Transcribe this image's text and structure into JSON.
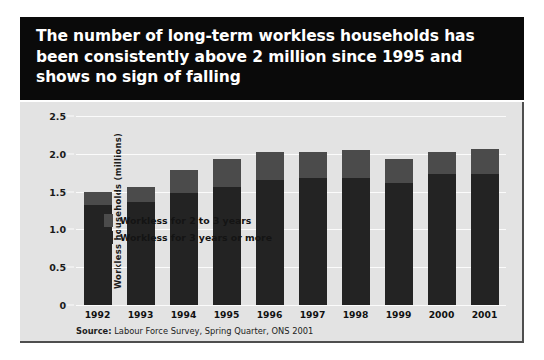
{
  "title": "The number of long-term workless households has been consistently above 2 million since 1995 and shows no sign of falling",
  "source": {
    "label": "Source:",
    "text": " Labour Force Survey, Spring Quarter, ONS 2001"
  },
  "colors": {
    "title_band": "#0a0a0a",
    "panel_background": "#e3e3e3",
    "gridline": "#fbfbfb",
    "series_2to3": "#4b4b4b",
    "series_3plus": "#232323",
    "page_background": "#ffffff"
  },
  "legend": [
    {
      "label": "Workless for 2 to 3 years",
      "color": "#4b4b4b"
    },
    {
      "label": "Workless for 3 years or more",
      "color": "#232323"
    }
  ],
  "chart_data": {
    "type": "bar",
    "stacked": true,
    "title": "The number of long-term workless households has been consistently above 2 million since 1995 and shows no sign of falling",
    "xlabel": "",
    "ylabel": "Workless households (millions)",
    "ylim": [
      0,
      2.5
    ],
    "yticks": [
      0,
      0.5,
      1.0,
      1.5,
      2.0,
      2.5
    ],
    "ytick_labels": [
      "0",
      "0.5",
      "1.0",
      "1.5",
      "2.0",
      "2.5"
    ],
    "grid": true,
    "legend_position": "top-left inside plot",
    "categories": [
      "1992",
      "1993",
      "1994",
      "1995",
      "1996",
      "1997",
      "1998",
      "1999",
      "2000",
      "2001"
    ],
    "series": [
      {
        "name": "Workless for 3 years or more",
        "color": "#232323",
        "values": [
          1.32,
          1.36,
          1.48,
          1.56,
          1.65,
          1.68,
          1.68,
          1.62,
          1.73,
          1.73
        ]
      },
      {
        "name": "Workless for 2 to 3 years",
        "color": "#4b4b4b",
        "values": [
          0.17,
          0.2,
          0.3,
          0.37,
          0.38,
          0.34,
          0.37,
          0.31,
          0.3,
          0.33
        ]
      }
    ],
    "totals": [
      1.49,
      1.56,
      1.78,
      1.93,
      2.03,
      2.02,
      2.05,
      1.93,
      2.03,
      2.06
    ],
    "source": "Source: Labour Force Survey, Spring Quarter, ONS 2001"
  }
}
